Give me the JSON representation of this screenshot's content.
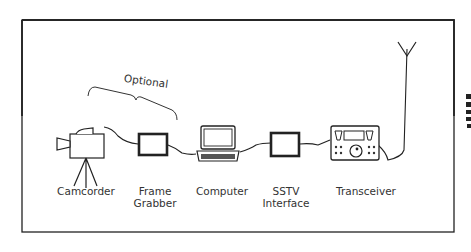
{
  "diagram": {
    "bracket_label": "Optional",
    "nodes": [
      {
        "id": "camcorder",
        "label_lines": [
          "Camcorder"
        ],
        "icon": "camcorder-on-tripod-icon"
      },
      {
        "id": "frame-grabber",
        "label_lines": [
          "Frame",
          "Grabber"
        ],
        "icon": "box-icon"
      },
      {
        "id": "computer",
        "label_lines": [
          "Computer"
        ],
        "icon": "laptop-icon"
      },
      {
        "id": "sstv-interface",
        "label_lines": [
          "SSTV",
          "Interface"
        ],
        "icon": "box-icon"
      },
      {
        "id": "transceiver",
        "label_lines": [
          "Transceiver"
        ],
        "icon": "radio-transceiver-icon"
      }
    ],
    "extra": {
      "antenna": "antenna-icon"
    },
    "colors": {
      "line": "#222222",
      "text": "#333333",
      "background": "#ffffff"
    }
  }
}
